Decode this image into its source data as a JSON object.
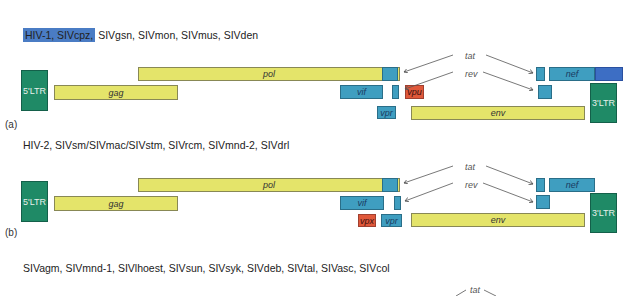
{
  "panels": [
    {
      "id": "a",
      "panel_label": "(a)",
      "title_highlight": "HIV-1, SIVcpz,",
      "title_rest": " SIVgsn, SIVmon, SIVmus, SIVden",
      "genes": {
        "ltr5": "5'LTR",
        "gag": "gag",
        "pol": "pol",
        "vif": "vif",
        "vpu": "vpu",
        "vpr": "vpr",
        "env": "env",
        "nef": "nef",
        "ltr3": "3'LTR"
      },
      "labels": {
        "tat": "tat",
        "rev": "rev"
      }
    },
    {
      "id": "b",
      "panel_label": "(b)",
      "title": "HIV-2, SIVsm/SIVmac/SIVstm, SIVrcm, SIVmnd-2, SIVdrl",
      "genes": {
        "ltr5": "5'LTR",
        "gag": "gag",
        "pol": "pol",
        "vif": "vif",
        "vpx": "vpx",
        "vpr": "vpr",
        "env": "env",
        "nef": "nef",
        "ltr3": "3'LTR"
      },
      "labels": {
        "tat": "tat",
        "rev": "rev"
      }
    },
    {
      "id": "c",
      "title": "SIVagm, SIVmnd-1, SIVlhoest, SIVsun, SIVsyk, SIVdeb, SIVtal, SIVasc, SIVcol",
      "labels": {
        "tat": "tat"
      }
    }
  ],
  "colors": {
    "structural": "#e4e46a",
    "accessory": "#3f9ec0",
    "vpu_vpx": "#e0583a",
    "ltr": "#1f8a66",
    "highlight": "#4a7cc4"
  }
}
